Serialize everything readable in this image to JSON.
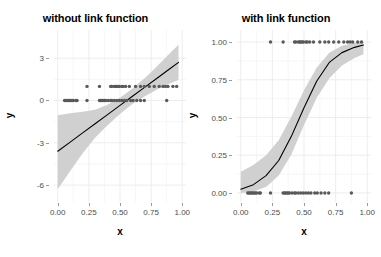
{
  "figure": {
    "background": "#ffffff",
    "width": 381,
    "height": 257
  },
  "style": {
    "ribbon_color": "#d0d0d0",
    "line_color": "#000000",
    "point_color": "#595959",
    "grid_color": "#ebebeb",
    "tick_text_color": "#4d4d4d",
    "title_color": "#000000"
  },
  "chart_data": [
    {
      "type": "scatter",
      "panel": "left",
      "title": "without link function",
      "xlabel": "x",
      "ylabel": "y",
      "xlim": [
        -0.03,
        1.03
      ],
      "ylim": [
        -7.2,
        5.0
      ],
      "xticks": [
        0.0,
        0.25,
        0.5,
        0.75,
        1.0
      ],
      "xtick_labels": [
        "0.00",
        "0.25",
        "0.50",
        "0.75",
        "1.00"
      ],
      "yticks": [
        3,
        0,
        -3,
        -6
      ],
      "ytick_labels": [
        "3",
        "0",
        "-3",
        "-6"
      ],
      "grid": true,
      "legend": "none",
      "annotation": "Linear (identity link) fit to binary 0/1 outcome data; shaded band is the confidence ribbon.",
      "fit_line": {
        "name": "linear fit",
        "x": [
          0.0,
          0.1,
          0.2,
          0.3,
          0.4,
          0.5,
          0.6,
          0.7,
          0.8,
          0.9,
          0.97
        ],
        "y": [
          -3.6,
          -2.95,
          -2.3,
          -1.65,
          -1.0,
          -0.35,
          0.3,
          0.95,
          1.6,
          2.25,
          2.7
        ]
      },
      "ribbon": {
        "name": "confidence band",
        "x": [
          0.0,
          0.1,
          0.2,
          0.3,
          0.4,
          0.5,
          0.6,
          0.7,
          0.8,
          0.9,
          0.97
        ],
        "ymin": [
          -6.3,
          -5.0,
          -3.75,
          -2.65,
          -1.75,
          -0.95,
          -0.25,
          0.3,
          0.8,
          1.2,
          1.45
        ],
        "ymax": [
          -1.05,
          -0.9,
          -0.8,
          -0.65,
          -0.3,
          0.2,
          0.85,
          1.6,
          2.45,
          3.35,
          3.95
        ]
      },
      "points": {
        "name": "observations",
        "x": [
          0.055,
          0.065,
          0.075,
          0.085,
          0.095,
          0.105,
          0.115,
          0.125,
          0.145,
          0.155,
          0.235,
          0.335,
          0.345,
          0.355,
          0.365,
          0.375,
          0.385,
          0.405,
          0.425,
          0.435,
          0.455,
          0.475,
          0.495,
          0.515,
          0.535,
          0.555,
          0.585,
          0.605,
          0.635,
          0.665,
          0.695,
          0.875,
          0.235,
          0.335,
          0.425,
          0.435,
          0.455,
          0.465,
          0.475,
          0.485,
          0.495,
          0.515,
          0.525,
          0.545,
          0.575,
          0.625,
          0.665,
          0.695,
          0.735,
          0.775,
          0.815,
          0.845,
          0.865,
          0.885,
          0.925,
          0.955
        ],
        "y": [
          0,
          0,
          0,
          0,
          0,
          0,
          0,
          0,
          0,
          0,
          0,
          0,
          0,
          0,
          0,
          0,
          0,
          0,
          0,
          0,
          0,
          0,
          0,
          0,
          0,
          0,
          0,
          0,
          0,
          0,
          0,
          0,
          1,
          1,
          1,
          1,
          1,
          1,
          1,
          1,
          1,
          1,
          1,
          1,
          1,
          1,
          1,
          1,
          1,
          1,
          1,
          1,
          1,
          1,
          1,
          1
        ]
      }
    },
    {
      "type": "scatter",
      "panel": "right",
      "title": "with link function",
      "xlabel": "x",
      "ylabel": "y",
      "xlim": [
        -0.03,
        1.03
      ],
      "ylim": [
        -0.06,
        1.08
      ],
      "xticks": [
        0.0,
        0.25,
        0.5,
        0.75,
        1.0
      ],
      "xtick_labels": [
        "0.00",
        "0.25",
        "0.50",
        "0.75",
        "1.00"
      ],
      "yticks": [
        1.0,
        0.75,
        0.5,
        0.25,
        0.0
      ],
      "ytick_labels": [
        "1.00",
        "0.75",
        "0.50",
        "0.25",
        "0.00"
      ],
      "grid": true,
      "legend": "none",
      "annotation": "Logistic (logit link) fit to the same binary 0/1 data; shaded band is the confidence ribbon.",
      "fit_line": {
        "name": "logistic fit",
        "x": [
          0.0,
          0.1,
          0.2,
          0.3,
          0.4,
          0.5,
          0.6,
          0.7,
          0.8,
          0.9,
          0.97
        ],
        "y": [
          0.025,
          0.055,
          0.115,
          0.215,
          0.375,
          0.565,
          0.74,
          0.865,
          0.93,
          0.965,
          0.98
        ]
      },
      "ribbon": {
        "name": "confidence band",
        "x": [
          0.0,
          0.1,
          0.2,
          0.3,
          0.4,
          0.5,
          0.6,
          0.7,
          0.8,
          0.9,
          0.97
        ],
        "ymin": [
          0.0,
          0.01,
          0.04,
          0.115,
          0.255,
          0.45,
          0.63,
          0.76,
          0.845,
          0.895,
          0.92
        ],
        "ymax": [
          0.14,
          0.185,
          0.25,
          0.35,
          0.505,
          0.68,
          0.83,
          0.93,
          0.975,
          0.995,
          1.0
        ]
      },
      "points": {
        "name": "observations",
        "x": [
          0.055,
          0.065,
          0.075,
          0.085,
          0.095,
          0.105,
          0.115,
          0.125,
          0.145,
          0.155,
          0.235,
          0.335,
          0.345,
          0.355,
          0.365,
          0.375,
          0.385,
          0.405,
          0.425,
          0.435,
          0.455,
          0.475,
          0.495,
          0.515,
          0.535,
          0.555,
          0.585,
          0.605,
          0.635,
          0.665,
          0.695,
          0.875,
          0.235,
          0.335,
          0.425,
          0.435,
          0.455,
          0.465,
          0.475,
          0.485,
          0.495,
          0.515,
          0.525,
          0.545,
          0.575,
          0.625,
          0.665,
          0.695,
          0.735,
          0.775,
          0.815,
          0.845,
          0.865,
          0.885,
          0.925,
          0.955
        ],
        "y": [
          0,
          0,
          0,
          0,
          0,
          0,
          0,
          0,
          0,
          0,
          0,
          0,
          0,
          0,
          0,
          0,
          0,
          0,
          0,
          0,
          0,
          0,
          0,
          0,
          0,
          0,
          0,
          0,
          0,
          0,
          0,
          0,
          1,
          1,
          1,
          1,
          1,
          1,
          1,
          1,
          1,
          1,
          1,
          1,
          1,
          1,
          1,
          1,
          1,
          1,
          1,
          1,
          1,
          1,
          1,
          1
        ]
      }
    }
  ]
}
